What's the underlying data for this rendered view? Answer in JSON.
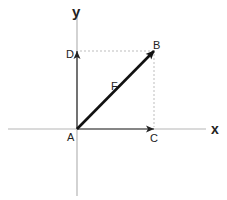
{
  "diagram": {
    "labels": {
      "y_axis": "y",
      "x_axis": "x",
      "origin": "A",
      "tip": "B",
      "x_component": "C",
      "y_component": "D",
      "vector": "F"
    },
    "points": {
      "A": [
        77,
        129
      ],
      "B": [
        154,
        51
      ],
      "C": [
        154,
        129
      ],
      "D": [
        77,
        51
      ]
    },
    "colors": {
      "axis": "#b5b5b5",
      "vector": "#111111",
      "dashed": "#bdbdbd",
      "text": "#222222"
    }
  }
}
